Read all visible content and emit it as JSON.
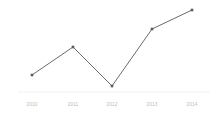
{
  "chart_data": {
    "type": "line",
    "title": "",
    "subtitle": "",
    "xlabel": "",
    "ylabel": "",
    "categories": [
      "2010",
      "2011",
      "2012",
      "2013",
      "2014"
    ],
    "values": [
      14,
      48,
      0,
      75,
      100
    ],
    "ylim": [
      0,
      100
    ],
    "grid": false,
    "legend": false,
    "legend_position": "none",
    "annotations": [],
    "series": [
      {
        "name": "",
        "values": [
          14,
          48,
          0,
          75,
          100
        ]
      }
    ],
    "tick_labels": {
      "x": [
        "2010",
        "2011",
        "2012",
        "2013",
        "2014"
      ],
      "y": []
    },
    "style": {
      "line_color": "#6b6b6b",
      "marker_color": "#5a5a5a",
      "marker_shape": "square",
      "axis_color": "#f2f2f2",
      "label_color": "#b9b9b9",
      "background": "#ffffff"
    },
    "pixel_geometry": {
      "points": [
        {
          "x": 32,
          "y": 75
        },
        {
          "x": 73,
          "y": 47
        },
        {
          "x": 112,
          "y": 86
        },
        {
          "x": 152,
          "y": 29
        },
        {
          "x": 192,
          "y": 10
        }
      ],
      "axis_y": 92,
      "label_y": 102
    }
  }
}
